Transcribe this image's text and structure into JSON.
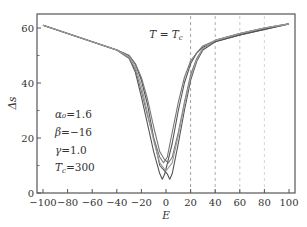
{
  "chart_data": {
    "type": "line",
    "title": "",
    "annotation_title": "T = T_c",
    "xlabel": "E",
    "ylabel": "Δs",
    "xlim": [
      -100,
      100
    ],
    "ylim": [
      0,
      65
    ],
    "xticks": [
      -100,
      -80,
      -60,
      -40,
      -20,
      0,
      20,
      40,
      60,
      80,
      100
    ],
    "xtick_labels": [
      "−100",
      "−80",
      "−60",
      "−40",
      "−20",
      "0",
      "20",
      "40",
      "60",
      "80",
      "100"
    ],
    "yticks": [
      0,
      20,
      40,
      60
    ],
    "ytick_labels": [
      "0",
      "20",
      "40",
      "60"
    ],
    "y_minor_ticks": [
      10,
      30,
      50
    ],
    "grid": false,
    "legend": null,
    "vlines": [
      {
        "x": 20,
        "style": "dashed",
        "color": "#888888"
      },
      {
        "x": 40,
        "style": "dashed",
        "color": "#999999"
      },
      {
        "x": 60,
        "style": "dashed",
        "color": "#bbbbbb"
      },
      {
        "x": 80,
        "style": "dashed",
        "color": "#cccccc"
      }
    ],
    "parameters": [
      {
        "label": "α₀",
        "value": "1.6"
      },
      {
        "label": "β",
        "value": "−16"
      },
      {
        "label": "γ",
        "value": "1.0"
      },
      {
        "label": "T_c",
        "value": "300"
      }
    ],
    "series": [
      {
        "name": "curve-1",
        "center": -3,
        "min": 5,
        "color": "#555555",
        "x": [
          -100,
          -80,
          -60,
          -40,
          -30,
          -25,
          -20,
          -15,
          -10,
          -5,
          -3,
          -1,
          5,
          10,
          15,
          20,
          25,
          30,
          40,
          60,
          80,
          100
        ],
        "y": [
          61,
          58,
          55,
          52,
          49,
          44,
          35,
          25,
          15,
          7,
          5,
          7,
          18,
          30,
          40,
          47,
          51,
          53,
          55,
          57.5,
          59.5,
          61.5
        ]
      },
      {
        "name": "curve-2",
        "center": 3,
        "min": 5,
        "color": "#555555",
        "x": [
          -100,
          -80,
          -60,
          -40,
          -30,
          -25,
          -20,
          -15,
          -10,
          -5,
          1,
          3,
          5,
          10,
          15,
          20,
          25,
          30,
          40,
          60,
          80,
          100
        ],
        "y": [
          61,
          58,
          55,
          52,
          50,
          47,
          41,
          32,
          20,
          10,
          7,
          5,
          7,
          18,
          30,
          41,
          48,
          52,
          55,
          57.5,
          59.5,
          61.5
        ]
      },
      {
        "name": "curve-3",
        "center": -2,
        "min": 11,
        "color": "#777777",
        "x": [
          -100,
          -80,
          -60,
          -40,
          -30,
          -25,
          -20,
          -15,
          -10,
          -5,
          -2,
          1,
          5,
          10,
          15,
          20,
          25,
          30,
          40,
          60,
          80,
          100
        ],
        "y": [
          61,
          58,
          55,
          52,
          49,
          45,
          37,
          28,
          20,
          13,
          11,
          13,
          22,
          33,
          42,
          48,
          51,
          53.5,
          55.5,
          58,
          60,
          61.5
        ]
      },
      {
        "name": "curve-4",
        "center": 2,
        "min": 11,
        "color": "#777777",
        "x": [
          -100,
          -80,
          -60,
          -40,
          -30,
          -25,
          -20,
          -15,
          -10,
          -5,
          -1,
          2,
          5,
          10,
          15,
          20,
          25,
          30,
          40,
          60,
          80,
          100
        ],
        "y": [
          61,
          58,
          55,
          52,
          50,
          47,
          42,
          34,
          24,
          15,
          12,
          11,
          13,
          22,
          33,
          43,
          49,
          52.5,
          55.5,
          58,
          60,
          61.5
        ]
      },
      {
        "name": "curve-5",
        "center": 0,
        "min": 8,
        "color": "#9a9a9a",
        "x": [
          -100,
          -80,
          -60,
          -40,
          -30,
          -25,
          -20,
          -15,
          -10,
          -5,
          0,
          5,
          10,
          15,
          20,
          25,
          30,
          40,
          60,
          80,
          100
        ],
        "y": [
          61,
          58,
          55,
          52,
          49.5,
          46,
          39,
          29,
          19,
          11,
          8,
          11,
          21,
          32,
          42,
          48.5,
          52.5,
          55.5,
          58,
          60,
          61.5
        ]
      }
    ]
  }
}
